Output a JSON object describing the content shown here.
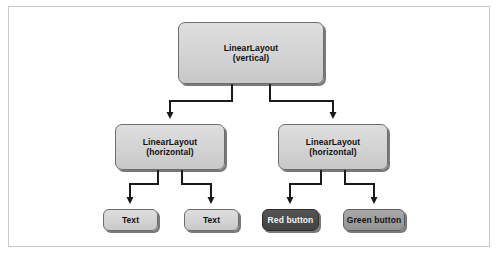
{
  "diagram": {
    "colors": {
      "frame_border": "#c9c9c9",
      "node_fill_light": "#d6d6d6",
      "node_fill_dark": "#4b4b4b",
      "node_fill_mid": "#9e9e9e",
      "node_border": "#6d6d6d",
      "connector": "#1a1a1a",
      "text_dark": "#101010",
      "text_light": "#f2f2f2"
    },
    "nodes": {
      "root": {
        "line1": "LinearLayout",
        "line2": "(vertical)"
      },
      "left_container": {
        "line1": "LinearLayout",
        "line2": "(horizontal)"
      },
      "right_container": {
        "line1": "LinearLayout",
        "line2": "(horizontal)"
      },
      "text1": {
        "label": "Text"
      },
      "text2": {
        "label": "Text"
      },
      "red_button": {
        "label": "Red button"
      },
      "green_button": {
        "label": "Green button"
      }
    },
    "edges": [
      {
        "from": "root",
        "to": "left_container"
      },
      {
        "from": "root",
        "to": "right_container"
      },
      {
        "from": "left_container",
        "to": "text1"
      },
      {
        "from": "left_container",
        "to": "text2"
      },
      {
        "from": "right_container",
        "to": "red_button"
      },
      {
        "from": "right_container",
        "to": "green_button"
      }
    ]
  }
}
